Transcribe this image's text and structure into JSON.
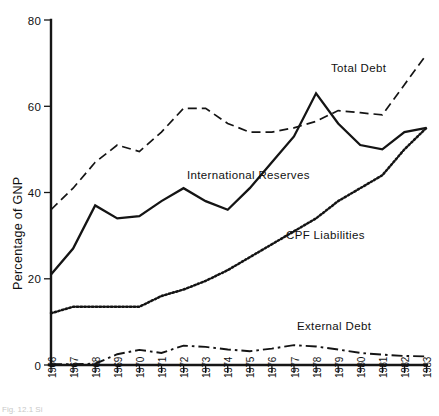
{
  "figure": {
    "caption": "Fig. 12.1  Si"
  },
  "chart_data": {
    "type": "line",
    "title": "",
    "xlabel": "",
    "ylabel": "Percentage of GNP",
    "xlim": [
      1966,
      1983
    ],
    "ylim": [
      0,
      80
    ],
    "grid": false,
    "legend_position": "inline-annotations",
    "yticks": [
      0,
      20,
      40,
      60,
      80
    ],
    "ytick_labels": [
      "0",
      "20",
      "40",
      "60",
      "80"
    ],
    "x": [
      1966,
      1967,
      1968,
      1969,
      1970,
      1971,
      1972,
      1973,
      1974,
      1975,
      1976,
      1977,
      1978,
      1979,
      1980,
      1981,
      1982,
      1983
    ],
    "xtick_labels": [
      "1966",
      "1967",
      "1968",
      "1969",
      "1970",
      "1971",
      "1972",
      "1973",
      "1974",
      "1975",
      "1976",
      "1977",
      "1978",
      "1979",
      "1980",
      "1981",
      "1982",
      "1983"
    ],
    "series": [
      {
        "name": "Total Debt",
        "style": "dashed",
        "label": "Total Debt",
        "values": [
          36,
          41,
          47,
          51,
          49.5,
          54,
          59.5,
          59.5,
          56,
          54,
          54,
          55,
          56.5,
          59,
          58.5,
          58,
          65,
          72
        ]
      },
      {
        "name": "International Reserves",
        "style": "solid",
        "label": "International Reserves",
        "values": [
          21,
          27,
          37,
          34,
          34.5,
          38,
          41,
          38,
          36,
          41,
          47,
          53,
          63,
          56,
          51,
          50,
          54,
          55
        ]
      },
      {
        "name": "CPF Liabilities",
        "style": "dotted",
        "label": "CPF Liabilities",
        "values": [
          12,
          13.5,
          13.5,
          13.5,
          13.5,
          16,
          17.5,
          19.5,
          22,
          25,
          28,
          31,
          34,
          38,
          41,
          44,
          50,
          55
        ]
      },
      {
        "name": "External Debt",
        "style": "dashdot",
        "label": "External Debt",
        "values": [
          0.2,
          0.2,
          0.3,
          2.5,
          3.5,
          2.8,
          4.5,
          4.2,
          3.6,
          3.2,
          3.8,
          4.6,
          4.3,
          3.6,
          2.8,
          2.4,
          2.1,
          2.0
        ]
      }
    ],
    "annotations": [
      {
        "text": "Total Debt",
        "x": 1979.3,
        "y": 69.5
      },
      {
        "text": "International Reserves",
        "x": 1972.1,
        "y": 41.0
      },
      {
        "text": "CPF Liabilities",
        "x": 1977.0,
        "y": 30.0
      },
      {
        "text": "External Debt",
        "x": 1978.2,
        "y": 9.0
      }
    ]
  }
}
